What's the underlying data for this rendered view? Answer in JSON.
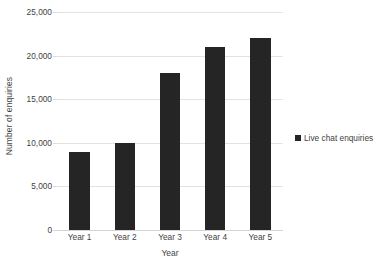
{
  "chart_data": {
    "type": "bar",
    "title": "",
    "subtitle": "",
    "categories": [
      "Year 1",
      "Year 2",
      "Year 3",
      "Year 4",
      "Year 5"
    ],
    "values": [
      9000,
      10000,
      18000,
      21000,
      22000
    ],
    "series": [
      {
        "name": "Live chat enquiries",
        "values": [
          9000,
          10000,
          18000,
          21000,
          22000
        ],
        "color": "#252525"
      }
    ],
    "xlabel": "Year",
    "ylabel": "Number of enquiries",
    "ylim": [
      0,
      25000
    ],
    "ytick_values": [
      0,
      5000,
      10000,
      15000,
      20000,
      25000
    ],
    "ytick_labels": [
      "0",
      "5,000",
      "10,000",
      "15,000",
      "20,000",
      "25,000"
    ],
    "grid": "horizontal",
    "legend_position": "right",
    "orientation": "vertical",
    "background_color": "#ffffff",
    "gridline_color": "#e2e2e2"
  },
  "axes": {
    "y_title": "Number of enquiries",
    "x_title": "Year"
  },
  "legend": {
    "entries": [
      {
        "label": "Live chat enquiries",
        "marker": "square-marker",
        "color": "#252525"
      }
    ]
  }
}
